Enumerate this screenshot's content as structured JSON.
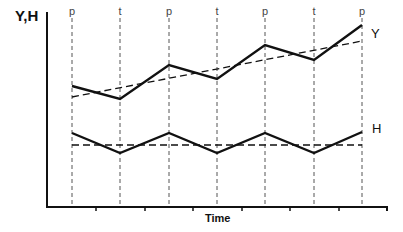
{
  "chart_data": {
    "type": "line",
    "title": "",
    "xlabel": "Time",
    "ylabel": "Y,H",
    "phase_markers": [
      "p",
      "t",
      "p",
      "t",
      "p",
      "t",
      "p"
    ],
    "x": [
      0,
      1,
      2,
      3,
      4,
      5,
      6
    ],
    "series": [
      {
        "name": "Y",
        "style": "solid",
        "values": [
          86,
          99,
          65,
          79,
          45,
          60,
          25
        ]
      },
      {
        "name": "Y trend",
        "style": "dashed",
        "values_endpoints": [
          97,
          41
        ]
      },
      {
        "name": "H",
        "style": "solid",
        "values": [
          133,
          153,
          133,
          153,
          133,
          153,
          132
        ]
      },
      {
        "name": "H trend",
        "style": "dashed",
        "values_endpoints": [
          145,
          145
        ]
      }
    ],
    "note": "Values are pixel-y positions (smaller = higher). Y grows cyclically around rising trend; H oscillates around flat mean.",
    "grid": false,
    "legend_position": "inline-right"
  },
  "layout": {
    "axis": {
      "x0": 47,
      "y0": 207,
      "x1": 387,
      "ytop": 12
    },
    "phase_x": [
      72,
      120,
      169,
      217,
      265,
      314,
      362
    ],
    "x_ticks": [
      96,
      145,
      193,
      242,
      290,
      339
    ]
  },
  "labels": {
    "y_axis": "Y,H",
    "x_axis": "Time",
    "series_y": "Y",
    "series_h": "H"
  },
  "colors": {
    "line": "#111111",
    "guide": "#555555"
  }
}
